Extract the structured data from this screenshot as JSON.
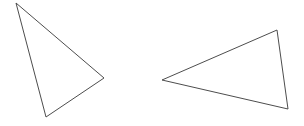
{
  "canvas": {
    "width": 304,
    "height": 126,
    "background_color": "#ffffff",
    "title": "Two Triangles"
  },
  "style": {
    "stroke_color": "#4d4d4d",
    "stroke_width": 1,
    "fill": "none"
  },
  "shapes": [
    {
      "name": "left-triangle",
      "type": "triangle",
      "points": "16,3 104,78 46,117",
      "vertices": [
        {
          "label": "apex-top-left",
          "x": 16,
          "y": 3
        },
        {
          "label": "vertex-right",
          "x": 104,
          "y": 78
        },
        {
          "label": "vertex-bottom",
          "x": 46,
          "y": 117
        }
      ],
      "stroke_color": "#4d4d4d",
      "fill": "none"
    },
    {
      "name": "right-triangle",
      "type": "triangle",
      "points": "162,80 277,30 288,109",
      "vertices": [
        {
          "label": "vertex-left",
          "x": 162,
          "y": 80
        },
        {
          "label": "vertex-top-right",
          "x": 277,
          "y": 30
        },
        {
          "label": "vertex-bottom-right",
          "x": 288,
          "y": 109
        }
      ],
      "stroke_color": "#4d4d4d",
      "fill": "none"
    }
  ]
}
